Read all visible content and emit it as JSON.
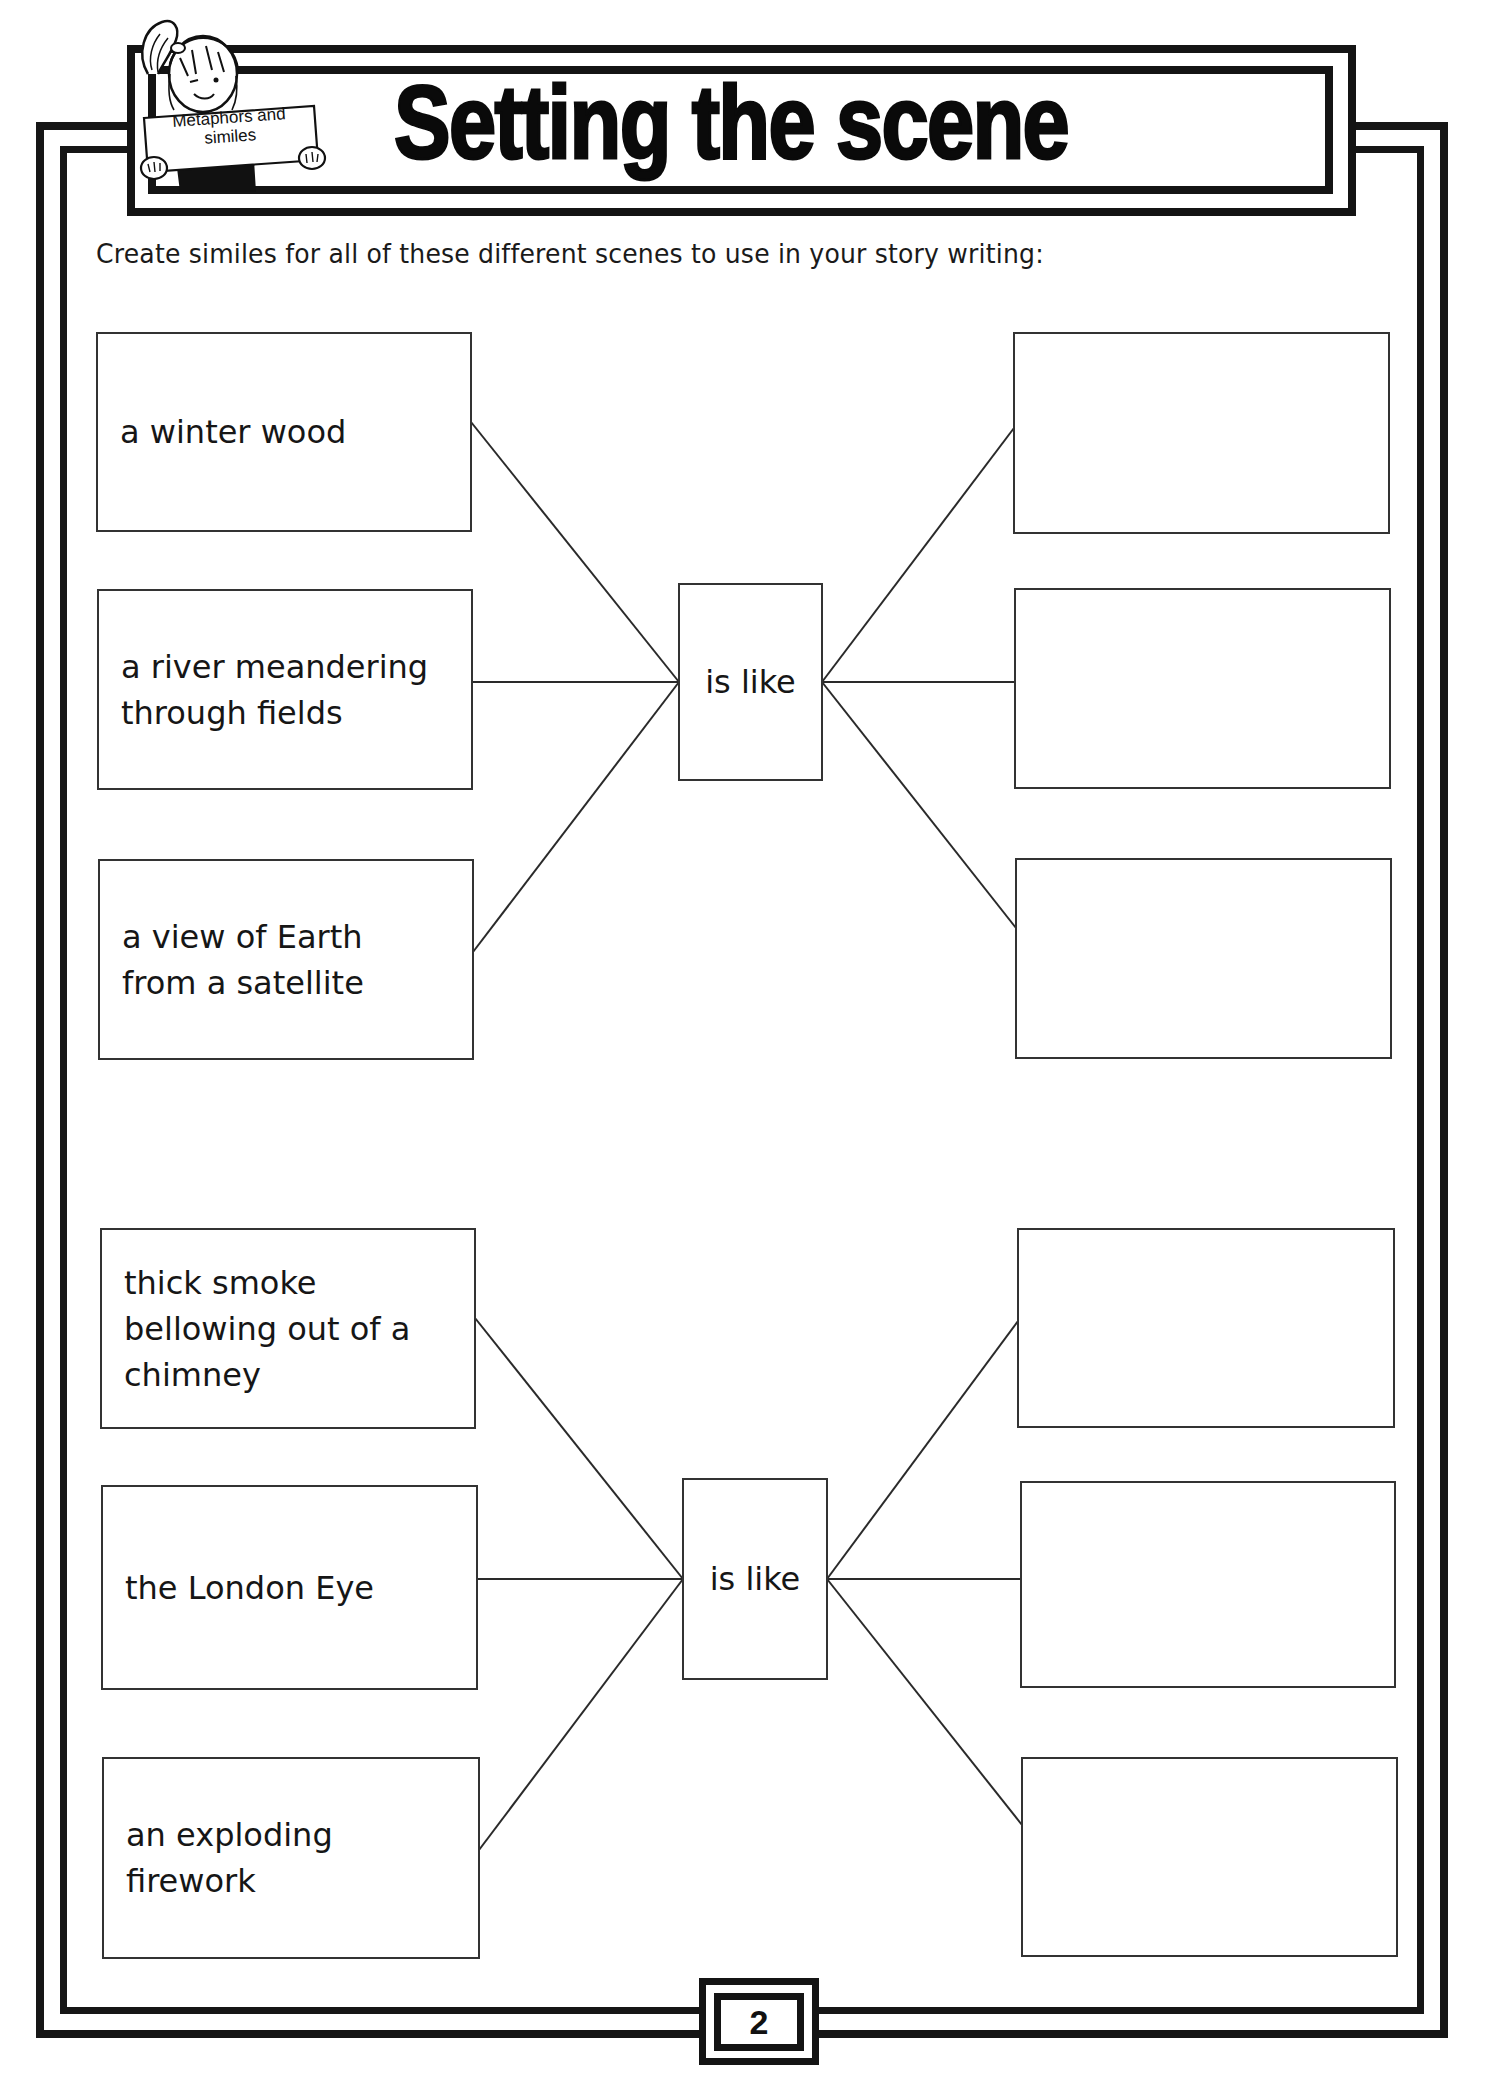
{
  "header": {
    "badge_label": "Metaphors and similes",
    "title": "Setting the scene"
  },
  "instruction": "Create similes for all of these different scenes to use in your story writing:",
  "connector_label": "is like",
  "groups": [
    {
      "scenes": [
        {
          "label": "a winter wood"
        },
        {
          "label": "a river meandering\nthrough fields"
        },
        {
          "label": "a view of Earth\nfrom a satellite"
        }
      ],
      "connector": "is like",
      "answers": [
        {
          "value": ""
        },
        {
          "value": ""
        },
        {
          "value": ""
        }
      ]
    },
    {
      "scenes": [
        {
          "label": "thick smoke\nbellowing out of a\nchimney"
        },
        {
          "label": "the London Eye"
        },
        {
          "label": "an exploding\nfirework"
        }
      ],
      "connector": "is like",
      "answers": [
        {
          "value": ""
        },
        {
          "value": ""
        },
        {
          "value": ""
        }
      ]
    }
  ],
  "footer": {
    "page_number": "2"
  },
  "colors": {
    "ink": "#141414",
    "line": "#333333",
    "paper": "#ffffff"
  }
}
